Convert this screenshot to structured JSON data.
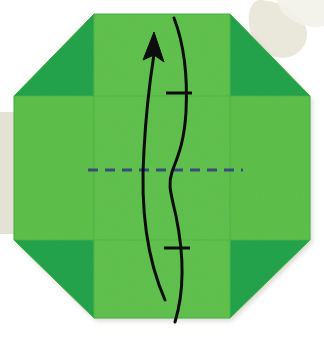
{
  "figure": {
    "description": "Green octagonal folded paper sheet viewed flat, with a horizontal dashed valley-fold line across the centre and a curved arrow indicating the bottom edge folds upward.",
    "step_label": "",
    "shape_name": "octagon",
    "background": {
      "page_color": "#ffffff",
      "paper_shadow_color": "#e8e7dd",
      "blob_top_right_color": "#e9e7d8",
      "band_left_color": "#e7e6da"
    },
    "paper": {
      "front_color": "#5cbf4a",
      "front_color_light": "#62c14e",
      "back_color": "#22a14a",
      "flap_shade_color": "#2aa850",
      "edge_color": "#3fae40",
      "octagon_points": "94,14 230,14 310,96 310,240 230,318 94,318 14,240 14,96",
      "vertical_fold_left_x": 94,
      "vertical_fold_right_x": 230,
      "horizontal_fold_top_y": 96,
      "horizontal_fold_bottom_y": 240
    },
    "annotations": {
      "valley_fold": {
        "name": "valley-fold-dashed-line",
        "color": "#3c4a78",
        "dash_pattern": "10 7",
        "stroke_width": 3.2,
        "y": 170,
        "x_start": 88,
        "x_end": 243
      },
      "fold_arrow": {
        "name": "fold-direction-arrow",
        "color": "#0d0d0d",
        "stroke_width": 3.0,
        "arrow_path": "M 165,300 C 143,250 141,196 144,150 C 146,112 150,80 154,54",
        "arrow_head_points": "154,32 164,62 154,55 143,60",
        "guide_path": "M 175,322 C 186,286 183,250 176,216 C 170,190 168,184 172,172 C 176,160 184,146 186,112 C 188,72 184,44 174,18",
        "tick_marks": [
          {
            "name": "tick-mark-upper",
            "x1": 166,
            "y1": 93,
            "x2": 192,
            "y2": 93
          },
          {
            "name": "tick-mark-lower",
            "x1": 164,
            "y1": 248,
            "x2": 190,
            "y2": 248
          }
        ]
      }
    }
  }
}
